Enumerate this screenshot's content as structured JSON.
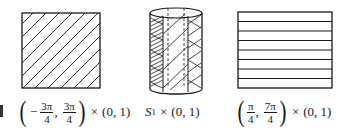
{
  "figure": {
    "panels": [
      {
        "id": "left",
        "shape": "rectangle",
        "hatching": "diagonal",
        "label": {
          "open_paren": "(",
          "sign": "−",
          "frac1_num": "3π",
          "frac1_den": "4",
          "comma": ",",
          "frac2_num": "3π",
          "frac2_den": "4",
          "close_paren": ")",
          "times": "×",
          "interval": "(0, 1)"
        }
      },
      {
        "id": "middle",
        "shape": "cylinder",
        "hatching": "mixed diagonal with vertical strip",
        "label": {
          "set": "S",
          "subscript": "1",
          "times": "×",
          "interval": "(0, 1)"
        }
      },
      {
        "id": "right",
        "shape": "rectangle",
        "hatching": "horizontal",
        "label": {
          "open_paren": "(",
          "frac1_num": "π",
          "frac1_den": "4",
          "comma": ",",
          "frac2_num": "7π",
          "frac2_den": "4",
          "close_paren": ")",
          "times": "×",
          "interval": "(0, 1)"
        }
      }
    ],
    "colors": {
      "ink": "#1a1a1a",
      "background": "#ffffff"
    }
  }
}
